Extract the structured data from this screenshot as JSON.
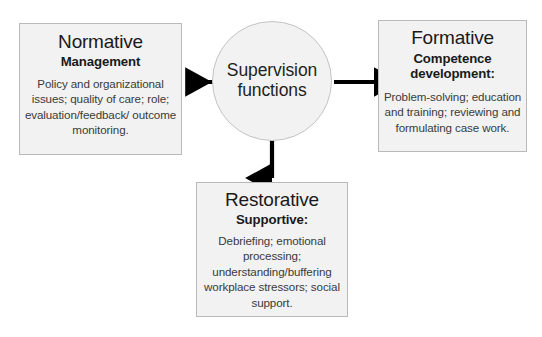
{
  "diagram": {
    "title": "Supervision functions",
    "center": {
      "label_line1": "Supervision",
      "label_line2": "functions"
    },
    "nodes": [
      {
        "id": "normative",
        "title": "Normative",
        "subtitle": "Management",
        "body": "Policy and organizational issues; quality of care; role; evaluation/feedback/ outcome monitoring.",
        "position": "left"
      },
      {
        "id": "formative",
        "title": "Formative",
        "subtitle": "Competence development:",
        "body": "Problem-solving; education and training; reviewing and formulating case work.",
        "position": "right"
      },
      {
        "id": "restorative",
        "title": "Restorative",
        "subtitle": "Supportive:",
        "body": "Debriefing; emotional processing; understanding/buffering workplace stressors; social support.",
        "position": "bottom"
      }
    ],
    "arrows": [
      {
        "id": "arrow-to-normative",
        "direction": "left",
        "from": "center",
        "to": "normative"
      },
      {
        "id": "arrow-to-formative",
        "direction": "right",
        "from": "center",
        "to": "formative"
      },
      {
        "id": "arrow-to-restorative",
        "direction": "down",
        "from": "center",
        "to": "restorative"
      }
    ],
    "colors": {
      "box_fill": "#f2f2f2",
      "box_border": "#b9b9b9",
      "arrow": "#000000",
      "text": "#231f20",
      "background": "#ffffff"
    }
  }
}
